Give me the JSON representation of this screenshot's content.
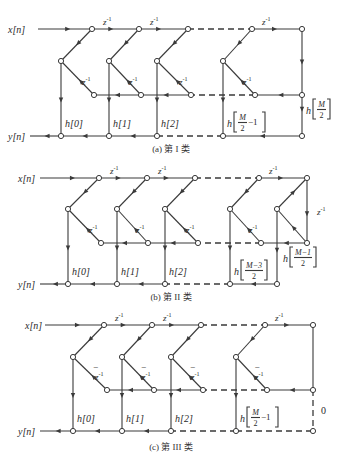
{
  "figure": {
    "colors": {
      "line": "#3a3a3a",
      "text": "#2a2a2a",
      "background": "#ffffff"
    }
  },
  "panels": [
    {
      "id": "a",
      "caption": "(a) 第 I 类",
      "input_label": "x[n]",
      "output_label": "y[n]",
      "delay_label": "z^-1",
      "top_y": 29,
      "mid_y": 61,
      "low_y": 95,
      "out_y": 136,
      "caption_y": 152,
      "x_start": 38,
      "x_end": 302,
      "in_label_x": 8,
      "out_label_x": 8,
      "stages": [
        {
          "top_x": 92,
          "left_x": 61,
          "low_x": 94,
          "coef": "h[0]"
        },
        {
          "top_x": 139,
          "left_x": 109,
          "low_x": 141,
          "coef": "h[1]"
        },
        {
          "top_x": 188,
          "left_x": 157,
          "low_x": 191,
          "coef": "h[2]"
        },
        {
          "top_x": 252,
          "left_x": 223,
          "low_x": 255,
          "coef": "h[M/2 - 1]"
        }
      ],
      "tail": {
        "type": "I",
        "right_x": 302,
        "coef": "h[M/2]"
      },
      "dashed_after_stage": 2,
      "minus_signs": false
    },
    {
      "id": "b",
      "caption": "(b) 第 II 类",
      "input_label": "x[n]",
      "output_label": "y[n]",
      "delay_label": "z^-1",
      "top_y": 178,
      "mid_y": 209,
      "low_y": 243,
      "out_y": 284,
      "caption_y": 300,
      "x_start": 40,
      "x_end": 307,
      "in_label_x": 18,
      "out_label_x": 18,
      "stages": [
        {
          "top_x": 99,
          "left_x": 68,
          "low_x": 101,
          "coef": "h[0]"
        },
        {
          "top_x": 147,
          "left_x": 117,
          "low_x": 148,
          "coef": "h[1]"
        },
        {
          "top_x": 195,
          "left_x": 165,
          "low_x": 198,
          "coef": "h[2]"
        },
        {
          "top_x": 259,
          "left_x": 230,
          "low_x": 261,
          "coef": "h[(M-3)/2]"
        }
      ],
      "tail": {
        "type": "II",
        "right_x": 307,
        "left_x": 277,
        "coef": "h[(M-1)/2]",
        "delay_label": "z^-1"
      },
      "dashed_after_stage": 2,
      "minus_signs": false
    },
    {
      "id": "c",
      "caption": "(c) 第 III 类",
      "input_label": "x[n]",
      "output_label": "y[n]",
      "delay_label": "z^-1",
      "top_y": 325,
      "mid_y": 357,
      "low_y": 390,
      "out_y": 431,
      "caption_y": 450,
      "x_start": 45,
      "x_end": 313,
      "in_label_x": 25,
      "out_label_x": 18,
      "stages": [
        {
          "top_x": 104,
          "left_x": 73,
          "low_x": 107,
          "coef": "h[0]"
        },
        {
          "top_x": 152,
          "left_x": 122,
          "low_x": 154,
          "coef": "h[1]"
        },
        {
          "top_x": 201,
          "left_x": 171,
          "low_x": 203,
          "coef": "h[2]"
        },
        {
          "top_x": 265,
          "left_x": 236,
          "low_x": 267,
          "coef": "h[M/2 - 1]"
        }
      ],
      "tail": {
        "type": "III",
        "right_x": 313,
        "coef": "0"
      },
      "dashed_after_stage": 2,
      "minus_signs": true,
      "minus_label": "−"
    }
  ]
}
